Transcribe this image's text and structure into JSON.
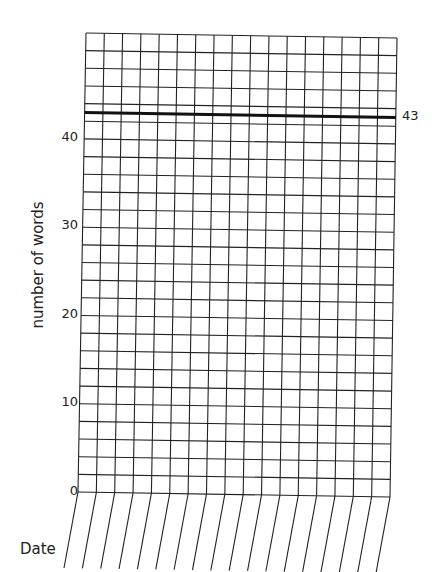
{
  "chart_data": {
    "type": "line",
    "title": "",
    "xlabel": "Date",
    "ylabel": "number of words",
    "ylim": [
      0,
      52
    ],
    "y_ticks": [
      0,
      10,
      20,
      30,
      40
    ],
    "y_tick_labels": [
      "0",
      "10",
      "20",
      "30",
      "40"
    ],
    "row_step": 2,
    "columns": 17,
    "categories": [
      "",
      "",
      "",
      "",
      "",
      "",
      "",
      "",
      "",
      "",
      "",
      "",
      "",
      "",
      "",
      "",
      ""
    ],
    "series": [],
    "annotations": [
      {
        "type": "goal-line",
        "y": 43,
        "label": "43"
      }
    ],
    "grid": true,
    "legend": "none"
  },
  "labels": {
    "xlabel": "Date",
    "ylabel": "number of words",
    "goal": "43",
    "ticks": [
      "0",
      "10",
      "20",
      "30",
      "40"
    ]
  },
  "colors": {
    "grid": "#222222",
    "goal_line": "#111111",
    "background": "#ffffff"
  }
}
